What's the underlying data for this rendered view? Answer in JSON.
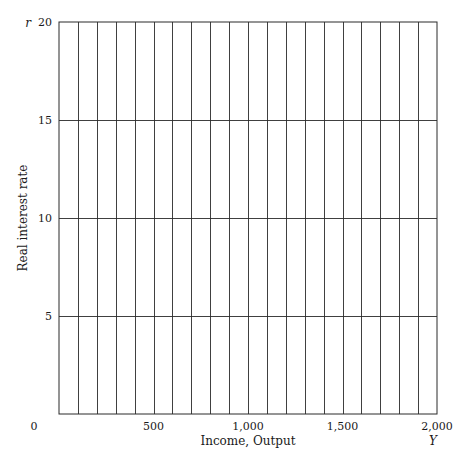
{
  "chart_data": {
    "type": "line",
    "title": "",
    "xlabel": "Income, Output",
    "ylabel": "Real interest rate",
    "x_var": "Y",
    "y_var": "r",
    "xlim": [
      0,
      2000
    ],
    "ylim": [
      0,
      20
    ],
    "x_ticks": [
      0,
      500,
      1000,
      1500,
      2000
    ],
    "x_tick_labels": [
      "0",
      "500",
      "1,000",
      "1,500",
      "2,000"
    ],
    "y_ticks": [
      5,
      10,
      15,
      20
    ],
    "y_tick_labels": [
      "5",
      "10",
      "15",
      "20"
    ],
    "x_grid_step": 100,
    "y_grid_step": 5,
    "grid": true,
    "series": [],
    "legend": null
  },
  "colors": {
    "grid": "#2a2a2a",
    "text": "#1a1a1a",
    "background": "#ffffff"
  }
}
